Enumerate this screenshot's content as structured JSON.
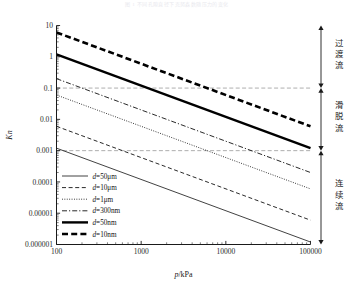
{
  "figure": {
    "faint_header": "图 1  不同孔隙直径下克努森数随压力的变化",
    "background": "#ffffff",
    "axis_color": "#1a1a1a",
    "grid_color": "#9a9a9a"
  },
  "chart_data": {
    "type": "line",
    "title": "",
    "xlabel": "p/kPa",
    "ylabel": "Kn",
    "xscale": "log",
    "yscale": "log",
    "xlim": [
      100,
      100000
    ],
    "ylim": [
      1e-06,
      10
    ],
    "grid": false,
    "legend_position": "lower-left-inside",
    "xticks": [
      "100",
      "1000",
      "10000",
      "100000"
    ],
    "xtick_values": [
      100,
      1000,
      10000,
      100000
    ],
    "yticks": [
      "10",
      "1",
      "0.1",
      "0.01",
      "0.001",
      "0.0001",
      "0.00001",
      "0.000001"
    ],
    "ytick_values": [
      10,
      1,
      0.1,
      0.01,
      0.001,
      0.0001,
      1e-05,
      1e-06
    ],
    "series": [
      {
        "name": "d=50μm",
        "key": "d50um",
        "style": "solid-thin",
        "color": "#111111",
        "width": 0.8,
        "x": [
          100,
          100000
        ],
        "y": [
          0.0012,
          1.2e-06
        ]
      },
      {
        "name": "d=10μm",
        "key": "d10um",
        "style": "dashed",
        "color": "#111111",
        "width": 0.9,
        "x": [
          100,
          100000
        ],
        "y": [
          0.006,
          6e-06
        ]
      },
      {
        "name": "d=1μm",
        "key": "d1um",
        "style": "dotted",
        "color": "#111111",
        "width": 0.9,
        "x": [
          100,
          100000
        ],
        "y": [
          0.06,
          6e-05
        ]
      },
      {
        "name": "d=300nm",
        "key": "d300nm",
        "style": "dash-dot",
        "color": "#111111",
        "width": 0.9,
        "x": [
          100,
          100000
        ],
        "y": [
          0.2,
          0.0002
        ]
      },
      {
        "name": "d=50nm",
        "key": "d50nm",
        "style": "solid-thick",
        "color": "#000000",
        "width": 2.4,
        "x": [
          100,
          100000
        ],
        "y": [
          1.2,
          0.0012
        ]
      },
      {
        "name": "d=10nm",
        "key": "d10nm",
        "style": "dashed-thick",
        "color": "#000000",
        "width": 2.6,
        "x": [
          100,
          100000
        ],
        "y": [
          6.0,
          0.006
        ]
      }
    ],
    "reference_lines": [
      {
        "name": "Kn=0.1",
        "y": 0.1,
        "style": "dashed",
        "color": "#8a8a8a"
      },
      {
        "name": "Kn=0.001",
        "y": 0.001,
        "style": "dashed",
        "color": "#8a8a8a"
      }
    ],
    "annotations": [
      {
        "label": "过渡流",
        "range": [
          0.1,
          10
        ],
        "region": "transition-flow"
      },
      {
        "label": "滑脱流",
        "range": [
          0.001,
          0.1
        ],
        "region": "slip-flow"
      },
      {
        "label": "连续流",
        "range": [
          1e-06,
          0.001
        ],
        "region": "continuum-flow"
      }
    ]
  }
}
